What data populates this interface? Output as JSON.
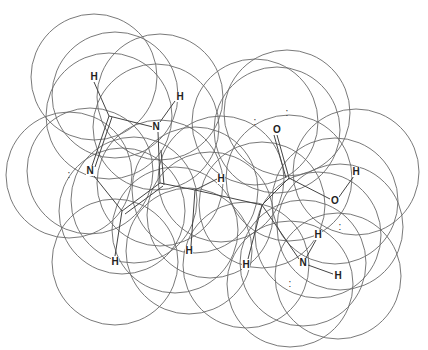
{
  "diagram": {
    "title": "",
    "radius": 63,
    "circles": [
      [
        94,
        77
      ],
      [
        115,
        95
      ],
      [
        160,
        97
      ],
      [
        156,
        127
      ],
      [
        109,
        116
      ],
      [
        90,
        171
      ],
      [
        69,
        175
      ],
      [
        160,
        183
      ],
      [
        122,
        211
      ],
      [
        134,
        200
      ],
      [
        115,
        262
      ],
      [
        221,
        179
      ],
      [
        195,
        190
      ],
      [
        189,
        251
      ],
      [
        277,
        130
      ],
      [
        255,
        122
      ],
      [
        287,
        113
      ],
      [
        289,
        178
      ],
      [
        335,
        201
      ],
      [
        356,
        172
      ],
      [
        262,
        205
      ],
      [
        246,
        265
      ],
      [
        303,
        263
      ],
      [
        318,
        235
      ],
      [
        338,
        276
      ],
      [
        340,
        227
      ],
      [
        290,
        284
      ],
      [
        210,
        215
      ],
      [
        175,
        230
      ]
    ],
    "atoms": [
      {
        "id": "h1",
        "label": "H",
        "x": 94,
        "y": 77
      },
      {
        "id": "h2",
        "label": "H",
        "x": 180,
        "y": 97
      },
      {
        "id": "n1",
        "label": "N",
        "x": 156,
        "y": 127
      },
      {
        "id": "n2",
        "label": "N",
        "x": 90,
        "y": 171
      },
      {
        "id": "h3",
        "label": "H",
        "x": 115,
        "y": 262
      },
      {
        "id": "h4",
        "label": "H",
        "x": 221,
        "y": 179
      },
      {
        "id": "h5",
        "label": "H",
        "x": 189,
        "y": 251
      },
      {
        "id": "o1",
        "label": "O",
        "x": 277,
        "y": 130
      },
      {
        "id": "o2",
        "label": "O",
        "x": 335,
        "y": 201
      },
      {
        "id": "h6",
        "label": "H",
        "x": 356,
        "y": 172
      },
      {
        "id": "h7",
        "label": "H",
        "x": 246,
        "y": 265
      },
      {
        "id": "n3",
        "label": "N",
        "x": 303,
        "y": 263
      },
      {
        "id": "h8",
        "label": "H",
        "x": 318,
        "y": 235
      },
      {
        "id": "h9",
        "label": "H",
        "x": 338,
        "y": 276
      }
    ],
    "lone_pairs": [
      {
        "x": 69,
        "y": 175
      },
      {
        "x": 255,
        "y": 122
      },
      {
        "x": 287,
        "y": 113
      },
      {
        "x": 340,
        "y": 227
      },
      {
        "x": 290,
        "y": 284
      }
    ],
    "lone_pair_glyph": ":",
    "bonds": [
      [
        94,
        82,
        109,
        116
      ],
      [
        109,
        116,
        153,
        127
      ],
      [
        175,
        101,
        160,
        122
      ],
      [
        109,
        116,
        92,
        166
      ],
      [
        112,
        117,
        95,
        167
      ],
      [
        158,
        132,
        160,
        183
      ],
      [
        161,
        150,
        164,
        185
      ],
      [
        94,
        176,
        122,
        211
      ],
      [
        122,
        211,
        160,
        183
      ],
      [
        125,
        214,
        163,
        186
      ],
      [
        122,
        211,
        115,
        256
      ],
      [
        160,
        183,
        195,
        190
      ],
      [
        195,
        190,
        217,
        179
      ],
      [
        195,
        190,
        191,
        246
      ],
      [
        195,
        190,
        262,
        205
      ],
      [
        262,
        205,
        289,
        178
      ],
      [
        289,
        178,
        277,
        135
      ],
      [
        286,
        178,
        274,
        135
      ],
      [
        289,
        178,
        330,
        199
      ],
      [
        339,
        197,
        354,
        176
      ],
      [
        262,
        205,
        248,
        259
      ],
      [
        262,
        205,
        299,
        259
      ],
      [
        306,
        258,
        316,
        240
      ],
      [
        308,
        265,
        333,
        274
      ]
    ]
  }
}
